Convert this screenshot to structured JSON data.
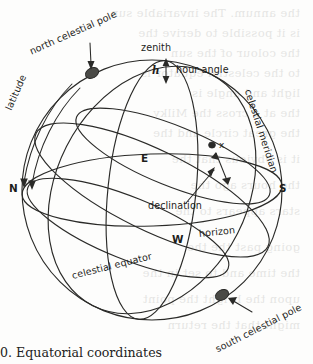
{
  "figure": {
    "title": "Equatorial coordinates",
    "caption": "0. Equatorial coordinates",
    "ghost_text": [
      "the annum. The invariable sun",
      "is it possible to derive the",
      "the colour of the sun",
      "to the celestial equator is",
      "light and angle is",
      "the at a cross the Milky",
      "the great circle and the",
      "it is obvious that the",
      "the hours ago the",
      "stars appears to the",
      "going past the the",
      "the time and to set in the",
      "upon the bright the point",
      "might that the return"
    ]
  },
  "labels": {
    "north_celestial_pole": "north celestial pole",
    "south_celestial_pole": "south celestial pole",
    "zenith": "zenith",
    "hour_angle": "hour angle",
    "hour_angle_symbol": "h",
    "latitude": "latitude",
    "celestial_meridian": "celestial meridian",
    "celestial_equator": "celestial equator",
    "horizon": "horizon",
    "declination": "declination",
    "star": "x",
    "north": "N",
    "south": "S",
    "east": "E",
    "west": "W"
  },
  "colors": {
    "ink": "#1d1d1b",
    "line": "#2a2a28",
    "paper": "#fdfdfc",
    "ghost": "#6a6a66",
    "pole_marker": "#4a4a46"
  },
  "geometry": {
    "sphere_center_x": 152,
    "sphere_center_y": 190,
    "sphere_radius_x": 130,
    "sphere_radius_y": 130,
    "north_pole_point": [
      92,
      73
    ],
    "south_pole_point": [
      222,
      295
    ],
    "star_point": [
      213,
      145
    ]
  }
}
